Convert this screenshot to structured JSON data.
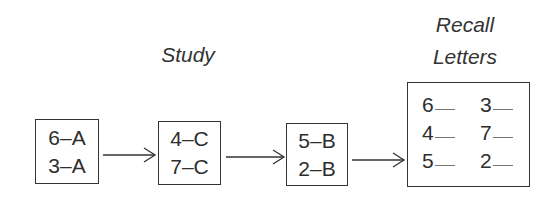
{
  "labels": {
    "study": "Study",
    "recall_line1": "Recall",
    "recall_line2": "Letters"
  },
  "study_boxes": [
    {
      "pairs": [
        "6–A",
        "3–A"
      ]
    },
    {
      "pairs": [
        "4–C",
        "7–C"
      ]
    },
    {
      "pairs": [
        "5–B",
        "2–B"
      ]
    }
  ],
  "recall_box": {
    "cells": [
      [
        "6",
        "3"
      ],
      [
        "4",
        "7"
      ],
      [
        "5",
        "2"
      ]
    ]
  },
  "arrows": [
    "arrow-right",
    "arrow-right",
    "arrow-right"
  ]
}
